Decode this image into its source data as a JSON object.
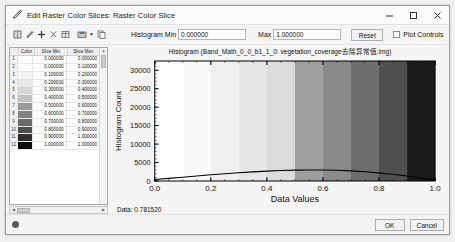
{
  "window": {
    "title": "Edit Raster Color Slices: Raster Color Slice",
    "title_icon": "pencil-icon",
    "minimize_icon": "minimize-icon",
    "maximize_icon": "maximize-icon",
    "close_icon": "close-icon"
  },
  "toolbar": {
    "icons": [
      "grid-icon",
      "eyedropper-icon",
      "plus-icon",
      "scissors-icon",
      "table-icon",
      "save-icon",
      "dropdown-caret-icon",
      "copy-icon"
    ],
    "histogram_min_label": "Histogram Min",
    "histogram_min_value": "0.000000",
    "max_label": "Max",
    "max_value": "1.000000",
    "reset_label": "Reset",
    "plot_controls_label": "Plot Controls",
    "plot_controls_checked": false
  },
  "table": {
    "columns": [
      "",
      "Color",
      "Slice Min",
      "Slice Max"
    ],
    "rows": [
      {
        "index": "1",
        "color": "#ffffff",
        "min": "0.000000",
        "max": "0.000000"
      },
      {
        "index": "2",
        "color": "#fdfdfd",
        "min": "0.000000",
        "max": "0.100000"
      },
      {
        "index": "3",
        "color": "#f4f4f4",
        "min": "0.100000",
        "max": "0.200000"
      },
      {
        "index": "4",
        "color": "#e8e8e8",
        "min": "0.200000",
        "max": "0.300000"
      },
      {
        "index": "5",
        "color": "#d6d6d6",
        "min": "0.300000",
        "max": "0.400000"
      },
      {
        "index": "6",
        "color": "#c2c2c2",
        "min": "0.400000",
        "max": "0.500000"
      },
      {
        "index": "7",
        "color": "#9a9a9a",
        "min": "0.500000",
        "max": "0.600000"
      },
      {
        "index": "8",
        "color": "#828282",
        "min": "0.600000",
        "max": "0.700000"
      },
      {
        "index": "9",
        "color": "#6a6a6a",
        "min": "0.700000",
        "max": "0.800000"
      },
      {
        "index": "10",
        "color": "#4e4e4e",
        "min": "0.800000",
        "max": "0.900000"
      },
      {
        "index": "11",
        "color": "#303030",
        "min": "0.900000",
        "max": "1.000000"
      },
      {
        "index": "12",
        "color": "#0d0d0d",
        "min": "1.000000",
        "max": "1.000000"
      }
    ]
  },
  "plot": {
    "data_readout": "Data: 0.781520"
  },
  "chart_data": {
    "type": "area",
    "title": "Histogram (Band_Math_0_0_b1_1_0: vegetation_coverage去除异常值.img)",
    "xlabel": "Data Values",
    "ylabel": "Histogram Count",
    "xlim": [
      0.0,
      1.0
    ],
    "ylim": [
      0,
      32500
    ],
    "xticks": [
      "0.0",
      "0.2",
      "0.4",
      "0.6",
      "0.8",
      "1.0"
    ],
    "xtick_values": [
      0.0,
      0.2,
      0.4,
      0.6,
      0.8,
      1.0
    ],
    "yticks": [
      "0",
      "5000",
      "10000",
      "15000",
      "20000",
      "25000",
      "30000"
    ],
    "ytick_values": [
      0,
      5000,
      10000,
      15000,
      20000,
      25000,
      30000
    ],
    "grid": false,
    "legend": null,
    "x": [
      0.0,
      0.05,
      0.1,
      0.15,
      0.2,
      0.25,
      0.3,
      0.35,
      0.4,
      0.45,
      0.5,
      0.55,
      0.6,
      0.65,
      0.7,
      0.75,
      0.8,
      0.85,
      0.9,
      0.95,
      1.0
    ],
    "values": [
      420,
      700,
      1010,
      1350,
      1680,
      1980,
      2250,
      2480,
      2680,
      2830,
      2940,
      2990,
      2985,
      2900,
      2740,
      2510,
      2200,
      1820,
      1340,
      760,
      170
    ],
    "series": [
      {
        "name": "Histogram Count",
        "values": [
          420,
          700,
          1010,
          1350,
          1680,
          1980,
          2250,
          2480,
          2680,
          2830,
          2940,
          2990,
          2985,
          2900,
          2740,
          2510,
          2200,
          1820,
          1340,
          760,
          170
        ]
      }
    ],
    "color_slices": [
      {
        "from": 0.0,
        "to": 0.1,
        "color": "#ffffff"
      },
      {
        "from": 0.1,
        "to": 0.2,
        "color": "#fafafa"
      },
      {
        "from": 0.2,
        "to": 0.3,
        "color": "#efefef"
      },
      {
        "from": 0.3,
        "to": 0.4,
        "color": "#e6e6e6"
      },
      {
        "from": 0.4,
        "to": 0.5,
        "color": "#dcdcdc"
      },
      {
        "from": 0.5,
        "to": 0.6,
        "color": "#9e9e9e"
      },
      {
        "from": 0.6,
        "to": 0.7,
        "color": "#8a8a8a"
      },
      {
        "from": 0.7,
        "to": 0.8,
        "color": "#6d6d6d"
      },
      {
        "from": 0.8,
        "to": 0.9,
        "color": "#4f4f4f"
      },
      {
        "from": 0.9,
        "to": 1.0,
        "color": "#1c1c1c"
      }
    ],
    "curve_color": "#000000",
    "plot_bg": "#ffffff"
  },
  "footer": {
    "help_icon": "help-icon",
    "ok_label": "OK",
    "cancel_label": "Cancel"
  }
}
